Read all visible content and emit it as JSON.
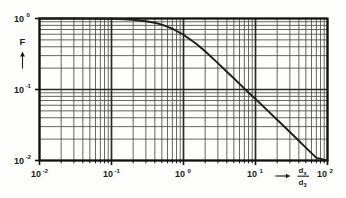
{
  "figure": {
    "type": "log-log-plot",
    "background_color": "#fdfdfc",
    "line_color": "#1d1d1d",
    "grid_major_color": "#2a2a2a",
    "grid_minor_color": "#4a4a4a"
  },
  "labels": {
    "y_axis_symbol": "F",
    "y_axis_arrow": "up-arrow",
    "x_axis_arrow": "right-arrow",
    "x_axis_numerator": "d",
    "x_axis_numerator_sub": "x",
    "x_axis_denominator": "d",
    "x_axis_denominator_sub": "3",
    "y_ticks": [
      {
        "mantissa": "10",
        "exponent": "0",
        "value": 1
      },
      {
        "mantissa": "10",
        "exponent": "-1",
        "value": 0.1
      },
      {
        "mantissa": "10",
        "exponent": "-2",
        "value": 0.01
      }
    ],
    "x_ticks": [
      {
        "mantissa": "10",
        "exponent": "-2",
        "value": 0.01
      },
      {
        "mantissa": "10",
        "exponent": "-1",
        "value": 0.1
      },
      {
        "mantissa": "10",
        "exponent": "0",
        "value": 1
      },
      {
        "mantissa": "10",
        "exponent": "1",
        "value": 10
      },
      {
        "mantissa": "10",
        "exponent": "2",
        "value": 100
      }
    ]
  },
  "chart_data": {
    "type": "line",
    "title": "",
    "xlabel": "dx / d3",
    "ylabel": "F",
    "xscale": "log",
    "yscale": "log",
    "xlim": [
      0.01,
      100
    ],
    "ylim": [
      0.01,
      1
    ],
    "grid": "major-and-minor-log",
    "legend": "none",
    "series": [
      {
        "name": "F",
        "x": [
          0.01,
          0.02,
          0.03,
          0.05,
          0.07,
          0.1,
          0.15,
          0.2,
          0.3,
          0.4,
          0.5,
          0.7,
          1.0,
          1.5,
          2.0,
          3.0,
          4.0,
          5.0,
          7.0,
          10.0,
          15.0,
          20.0,
          30.0,
          40.0,
          50.0,
          70.0,
          100.0
        ],
        "y": [
          1.0,
          1.0,
          0.999,
          0.997,
          0.994,
          0.99,
          0.975,
          0.96,
          0.915,
          0.87,
          0.82,
          0.72,
          0.59,
          0.44,
          0.345,
          0.235,
          0.178,
          0.144,
          0.103,
          0.0735,
          0.0495,
          0.0375,
          0.0252,
          0.019,
          0.0152,
          0.0109,
          0.01
        ]
      }
    ],
    "annotations": []
  }
}
